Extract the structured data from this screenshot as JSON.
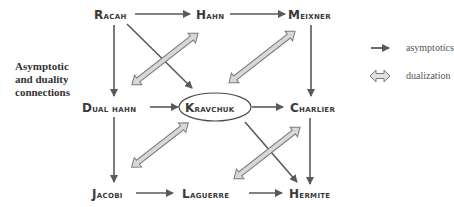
{
  "title_lines": [
    "Asymptotic",
    "and duality",
    "connections"
  ],
  "nodes": {
    "racah": {
      "first": "R",
      "rest": "acah"
    },
    "hahn": {
      "first": "H",
      "rest": "ahn"
    },
    "meixner": {
      "first": "M",
      "rest": "eixner"
    },
    "dual_hahn": {
      "first": "D",
      "rest": "ual hahn"
    },
    "kravchuk": {
      "first": "K",
      "rest": "ravchuk"
    },
    "charlier": {
      "first": "C",
      "rest": "harlier"
    },
    "jacobi": {
      "first": "J",
      "rest": "acobi"
    },
    "laguerre": {
      "first": "L",
      "rest": "aguerre"
    },
    "hermite": {
      "first": "H",
      "rest": "ermite"
    }
  },
  "legend": {
    "asymptotics": "asymptotics",
    "dualization": "dualization"
  },
  "colors": {
    "arrow": "#5a5a5a",
    "dual_fill": "#d8d8d8",
    "dual_stroke": "#7a7a7a",
    "text": "#3a3a3a"
  }
}
